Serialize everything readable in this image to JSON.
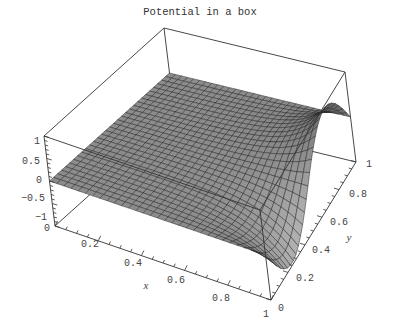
{
  "chart_data": {
    "type": "surface3d",
    "title": "Potential in a box",
    "xlabel": "x",
    "ylabel": "y",
    "zlabel": "",
    "x_range": [
      0,
      1
    ],
    "y_range": [
      0,
      1
    ],
    "z_range": [
      -1,
      1
    ],
    "x_ticks": [
      "0.2",
      "0.4",
      "0.6",
      "0.8",
      "1"
    ],
    "y_ticks": [
      "0",
      "0.2",
      "0.4",
      "0.6",
      "0.8",
      "1"
    ],
    "z_ticks": [
      "1",
      "0.5",
      "0",
      "-0.5",
      "-1"
    ],
    "z_origin_tick": "0",
    "grid_resolution": 30,
    "surface_color": "#8c8c8c",
    "mesh_color": "#1a1a1a"
  },
  "labels": {
    "title": "Potential in a box",
    "x_axis_name": "x",
    "y_axis_name": "y",
    "z_ticks": [
      "1",
      "0.5",
      "0",
      "−0.5",
      "−1"
    ],
    "z_zero": "0",
    "x_ticks": [
      "0.2",
      "0.4",
      "0.6",
      "0.8",
      "1"
    ],
    "y_ticks": [
      "0",
      "0.2",
      "0.4",
      "0.6",
      "0.8",
      "1"
    ]
  }
}
